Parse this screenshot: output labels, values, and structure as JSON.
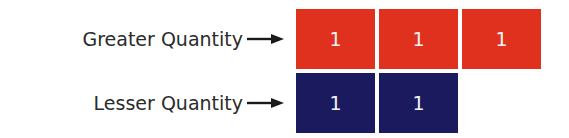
{
  "rows": [
    {
      "label": "Greater Quantity",
      "color": "#e0301e",
      "cells": [
        "1",
        "1",
        "1"
      ]
    },
    {
      "label": "Lesser Quantity",
      "color": "#1c1a5e",
      "cells": [
        "1",
        "1"
      ]
    }
  ],
  "icons": {
    "arrow": "right-arrow-icon"
  }
}
